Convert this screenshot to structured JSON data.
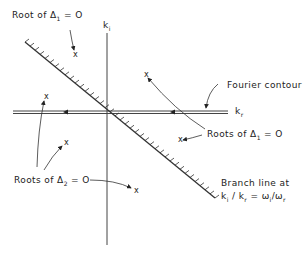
{
  "diagram": {
    "axes": {
      "vertical_label": "k",
      "vertical_label_sub": "i",
      "horizontal_label": "k",
      "horizontal_label_sub": "r"
    },
    "labels": {
      "root_delta1_top": {
        "prefix": "Root of Δ",
        "sub": "1",
        "suffix": " = O"
      },
      "fourier_contour": "Fourier contour",
      "roots_delta1": {
        "prefix": "Roots of Δ",
        "sub": "1",
        "suffix": " = O"
      },
      "roots_delta2": {
        "prefix": "Roots of Δ",
        "sub": "2",
        "suffix": " = O"
      },
      "branch_line_1": "Branch line at",
      "branch_line_2": {
        "k": "k",
        "ki": "i",
        "kr": "r",
        "w": "ω",
        "wi": "i",
        "wr": "r"
      }
    },
    "root_marker": "x",
    "line_color": "#333333"
  }
}
